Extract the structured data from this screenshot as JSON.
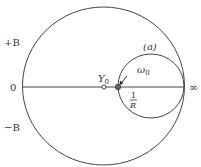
{
  "diagram": {
    "type": "smith-chart-admittance-circle",
    "labels": {
      "plus_b": "+B",
      "minus_b": "−B",
      "zero": "0",
      "infinity": "∞",
      "y0": "Y",
      "y0_sub": "0",
      "omega0": "ω",
      "omega0_sub": "0",
      "curve_a": "(a)",
      "one_over_r_num": "1",
      "one_over_r_den": "R"
    },
    "colors": {
      "stroke": "#444444",
      "text": "#333333",
      "background": "#ffffff"
    }
  }
}
